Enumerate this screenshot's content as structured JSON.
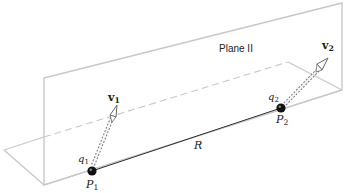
{
  "diagram": {
    "plane_label": "Plane II",
    "charges": [
      {
        "charge_symbol": "q",
        "charge_sub": "1",
        "point_symbol": "P",
        "point_sub": "1",
        "velocity_symbol": "v",
        "velocity_sub": "1"
      },
      {
        "charge_symbol": "q",
        "charge_sub": "2",
        "point_symbol": "P",
        "point_sub": "2",
        "velocity_symbol": "v",
        "velocity_sub": "2"
      }
    ],
    "separation_label": "R",
    "colors": {
      "plane_edge": "#c8c8c8",
      "dashed_edge": "#c8c8c8",
      "separation_line": "#333333",
      "charge_fill": "#111111",
      "arrow": "#666666"
    }
  }
}
